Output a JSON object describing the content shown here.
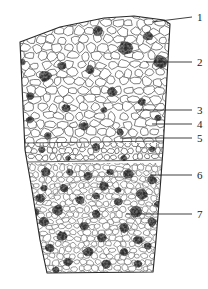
{
  "figure": {
    "type": "histological-cross-section",
    "caption_present": false,
    "background_color": "#ffffff",
    "ink_color": "#3a3a3a",
    "cluster_color": "#555555",
    "outline_color": "#2b2b2b",
    "width_px": 208,
    "height_px": 289
  },
  "labels": [
    {
      "id": "1",
      "text": "1",
      "x": 197,
      "y": 12,
      "leader_from_x": 192,
      "leader_from_y": 17,
      "leader_to_x": 152,
      "leader_to_y": 22
    },
    {
      "id": "2",
      "text": "2",
      "x": 197,
      "y": 57,
      "leader_from_x": 192,
      "leader_from_y": 62,
      "leader_to_x": 146,
      "leader_to_y": 62
    },
    {
      "id": "3",
      "text": "3",
      "x": 197,
      "y": 105,
      "leader_from_x": 192,
      "leader_from_y": 110,
      "leader_to_x": 136,
      "leader_to_y": 110
    },
    {
      "id": "4",
      "text": "4",
      "x": 197,
      "y": 119,
      "leader_from_x": 192,
      "leader_from_y": 124,
      "leader_to_x": 152,
      "leader_to_y": 124
    },
    {
      "id": "5",
      "text": "5",
      "x": 197,
      "y": 133,
      "leader_from_x": 192,
      "leader_from_y": 138,
      "leader_to_x": 120,
      "leader_to_y": 138
    },
    {
      "id": "6",
      "text": "6",
      "x": 197,
      "y": 170,
      "leader_from_x": 192,
      "leader_from_y": 175,
      "leader_to_x": 150,
      "leader_to_y": 175
    },
    {
      "id": "7",
      "text": "7",
      "x": 197,
      "y": 209,
      "leader_from_x": 192,
      "leader_from_y": 214,
      "leader_to_x": 126,
      "leader_to_y": 214
    }
  ],
  "regions": [
    {
      "name": "upper-cortex-region",
      "description": "large rounded parenchyma cells with scattered dark idioblast clusters",
      "top": 17,
      "bottom": 143
    },
    {
      "name": "separation-band-region",
      "description": "narrow pale band with short radial cells",
      "top": 143,
      "bottom": 163
    },
    {
      "name": "lower-cortex-region",
      "description": "denser small cells with abundant dark stone-cell clusters",
      "top": 163,
      "bottom": 274
    }
  ],
  "outline": {
    "name": "section-outline",
    "points": "20,42 60,27 104,18 134,16 164,20 170,24 163,150 160,190 156,240 153,272 47,273 40,240 32,190 25,150"
  }
}
